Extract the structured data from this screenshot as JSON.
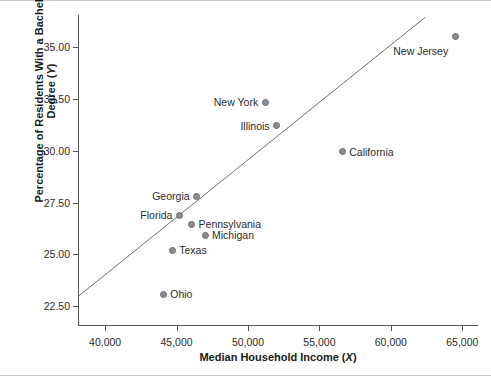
{
  "chart_data": {
    "type": "scatter",
    "title": "",
    "xlabel": "Median Household Income (X)",
    "xlabel_main": "Median Household Income (",
    "xlabel_var": "X",
    "xlabel_tail": ")",
    "ylabel": "Percentage of Residents With a Bachelor's Degree (Y)",
    "ylabel_main": "Percentage of Residents With a Bachelor's Degree (",
    "ylabel_var": "Y",
    "ylabel_tail": ")",
    "xlim": [
      38100,
      66100
    ],
    "ylim": [
      21.55,
      36.55
    ],
    "xticks": [
      40000,
      45000,
      50000,
      55000,
      60000,
      65000
    ],
    "xticklabels": [
      "40,000",
      "45,000",
      "50,000",
      "55,000",
      "60,000",
      "65,000"
    ],
    "yticks": [
      22.5,
      25.0,
      27.5,
      30.0,
      32.5,
      35.0
    ],
    "yticklabels": [
      "22.50",
      "25.00",
      "27.50",
      "30.00",
      "32.50",
      "35.00"
    ],
    "grid": false,
    "legend": false,
    "marker_color": "#8b8d92",
    "line_color": "#6f7075",
    "axis_color": "#55565a",
    "points": [
      {
        "label": "New Jersey",
        "x": 64500,
        "y": 35.5,
        "label_side": "left",
        "label_dy": 14
      },
      {
        "label": "New York",
        "x": 51200,
        "y": 32.35,
        "label_side": "left",
        "label_dy": 0
      },
      {
        "label": "Illinois",
        "x": 52000,
        "y": 31.2,
        "label_side": "left",
        "label_dy": 0
      },
      {
        "label": "California",
        "x": 56600,
        "y": 29.95,
        "label_side": "right",
        "label_dy": 0
      },
      {
        "label": "Georgia",
        "x": 46400,
        "y": 27.8,
        "label_side": "left",
        "label_dy": 0
      },
      {
        "label": "Florida",
        "x": 45200,
        "y": 26.88,
        "label_side": "left",
        "label_dy": 0
      },
      {
        "label": "Pennsylvania",
        "x": 46050,
        "y": 26.45,
        "label_side": "right",
        "label_dy": 0
      },
      {
        "label": "Michigan",
        "x": 46990,
        "y": 25.92,
        "label_side": "right",
        "label_dy": 0
      },
      {
        "label": "Texas",
        "x": 44700,
        "y": 25.2,
        "label_side": "right",
        "label_dy": 0
      },
      {
        "label": "Ohio",
        "x": 44070,
        "y": 23.08,
        "label_side": "right",
        "label_dy": 0
      }
    ],
    "regression_line": {
      "x1": 38100,
      "y1": 22.97,
      "x2": 62400,
      "y2": 36.44
    }
  }
}
